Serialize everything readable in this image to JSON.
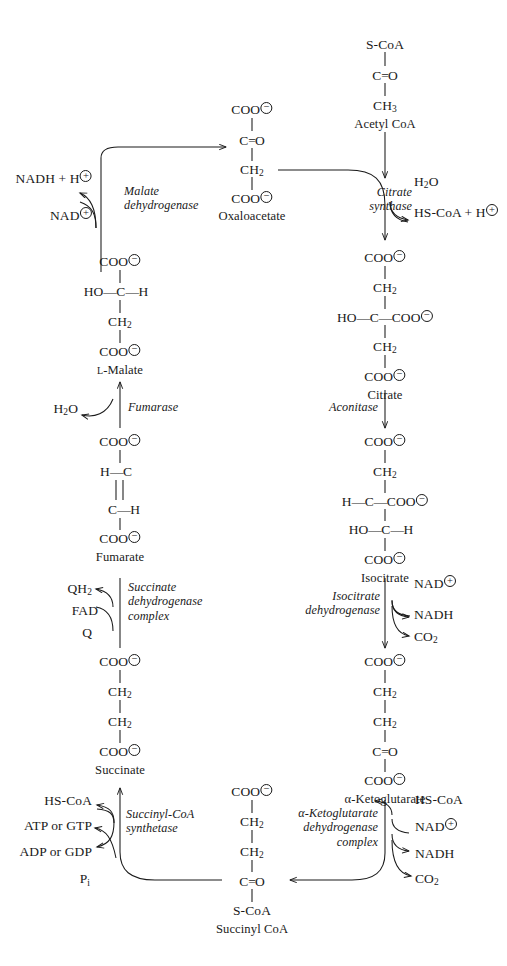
{
  "diagram": {
    "ink_color": "#1a1a1a",
    "background": "#ffffff"
  },
  "metabolites": {
    "acetyl_coa": {
      "name": "Acetyl CoA",
      "lines": [
        "S-CoA",
        "C=O",
        "CH3"
      ]
    },
    "oxaloacetate": {
      "name": "Oxaloacetate",
      "lines": [
        "COO-",
        "C=O",
        "CH2",
        "COO-"
      ]
    },
    "citrate": {
      "name": "Citrate",
      "lines": [
        "COO-",
        "CH2",
        "HO-C-COO-",
        "CH2",
        "COO-"
      ]
    },
    "isocitrate": {
      "name": "Isocitrate",
      "lines": [
        "COO-",
        "CH2",
        "H-C-COO-",
        "HO-C-H",
        "COO-"
      ]
    },
    "alpha_ketoglutarate": {
      "name": "α-Ketoglutarate",
      "lines": [
        "COO-",
        "CH2",
        "CH2",
        "C=O",
        "COO-"
      ]
    },
    "succinyl_coa": {
      "name": "Succinyl CoA",
      "lines": [
        "COO-",
        "CH2",
        "CH2",
        "C=O",
        "S-CoA"
      ]
    },
    "succinate": {
      "name": "Succinate",
      "lines": [
        "COO-",
        "CH2",
        "CH2",
        "COO-"
      ]
    },
    "fumarate": {
      "name": "Fumarate",
      "lines": [
        "COO-",
        "H-C",
        "||",
        "C-H",
        "COO-"
      ]
    },
    "l_malate": {
      "name": "L-Malate",
      "lines": [
        "COO-",
        "HO-C-H",
        "CH2",
        "COO-"
      ]
    }
  },
  "enzymes": {
    "citrate_synthase": {
      "line1": "Citrate",
      "line2": "synthase"
    },
    "aconitase": {
      "line1": "Aconitase",
      "line2": ""
    },
    "isocitrate_dehydrogenase": {
      "line1": "Isocitrate",
      "line2": "dehydrogenase"
    },
    "alpha_kg_dehydrogenase": {
      "line1": "α-Ketoglutarate",
      "line2": "dehydrogenase",
      "line3": "complex"
    },
    "succinyl_coa_synthetase": {
      "line1": "Succinyl-CoA",
      "line2": "synthetase"
    },
    "succinate_dehydrogenase": {
      "line1": "Succinate",
      "line2": "dehydrogenase",
      "line3": "complex"
    },
    "fumarase": {
      "line1": "Fumarase",
      "line2": ""
    },
    "malate_dehydrogenase": {
      "line1": "Malate",
      "line2": "dehydrogenase"
    }
  },
  "cofactors": {
    "citrate_synthase_in": "H2O",
    "citrate_synthase_out": "HS-CoA + H+",
    "icdh_in": "NAD+",
    "icdh_out1": "NADH",
    "icdh_out2": "CO2",
    "akgdh_in1": "HS-CoA",
    "akgdh_in2": "NAD+",
    "akgdh_out1": "NADH",
    "akgdh_out2": "CO2",
    "scs_out1": "HS-CoA",
    "scs_out2": "ATP or GTP",
    "scs_in1": "ADP or GDP",
    "scs_in2": "Pi",
    "sdh_out": "QH2",
    "sdh_mid": "FAD",
    "sdh_in": "Q",
    "fumarase_in": "H2O",
    "mdh_out": "NADH + H+",
    "mdh_in": "NAD+"
  },
  "labels": {
    "element_symbols": {
      "carbon": "C",
      "hydrogen": "H",
      "oxygen": "O",
      "sulfur": "S"
    },
    "charges": {
      "plus": "⊕",
      "minus": "⊖"
    }
  },
  "icons": {
    "arrow_head": "arrow-head-icon",
    "curved_connector": "curved-connector-icon"
  }
}
